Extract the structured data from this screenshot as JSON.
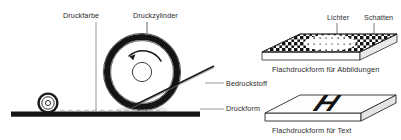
{
  "diagram": {
    "language": "de",
    "background_color": "#ffffff",
    "ink_color": "#1a1a1a",
    "text_color": "#2b2b2b",
    "labels": {
      "druckfarbe": "Druckfarbe",
      "druckzylinder": "Druckzylinder",
      "bedruckstoff": "Bedruckstoff",
      "druckform": "Druckform",
      "lichter": "Lichter",
      "schatten": "Schatten"
    },
    "captions": {
      "plate_images": "Flachdruckform für Abbildungen",
      "plate_text": "Flachdruckform für Text"
    },
    "plate_text_glyph": "H",
    "parts": [
      {
        "name": "ink-roller",
        "label": "Druckfarbe",
        "shape": "small-circle"
      },
      {
        "name": "printing-cylinder",
        "label": "Druckzylinder",
        "shape": "large-ring"
      },
      {
        "name": "substrate-sheet",
        "label": "Bedruckstoff",
        "shape": "diagonal-line"
      },
      {
        "name": "printing-form",
        "label": "Druckform",
        "shape": "thick-baseline"
      },
      {
        "name": "halftone-plate",
        "label": "Flachdruckform für Abbildungen",
        "shape": "isometric-slab"
      },
      {
        "name": "text-plate",
        "label": "Flachdruckform für Text",
        "shape": "isometric-slab"
      }
    ],
    "rotation_arrow": "clockwise"
  }
}
